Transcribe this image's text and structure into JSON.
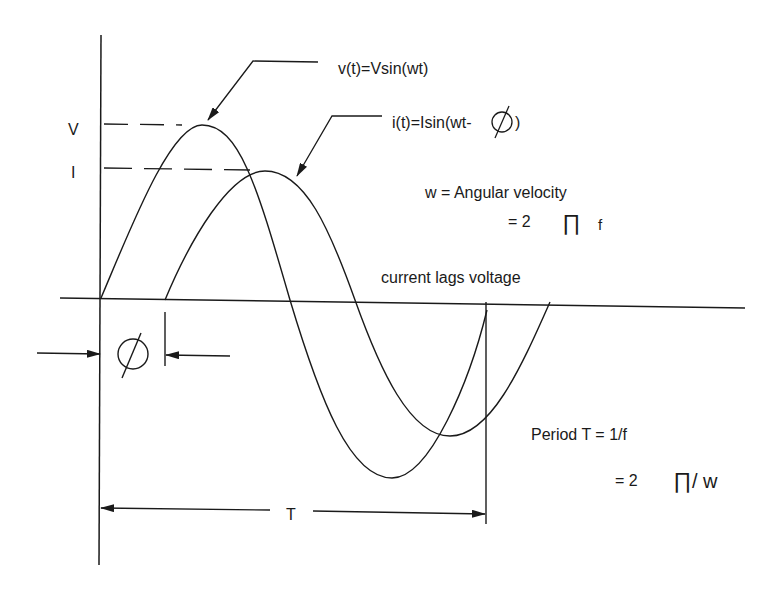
{
  "diagram": {
    "axis_labels": {
      "v_peak": "V",
      "i_peak": "I"
    },
    "callouts": {
      "voltage": "v(t)=Vsin(wt)",
      "current_prefix": "i(t)=Isin(wt-",
      "current_suffix": ")"
    },
    "notes": {
      "angular_velocity": "w = Angular velocity",
      "angular_eq_prefix": "= 2",
      "angular_eq_pi": "∏",
      "angular_eq_suffix": "f",
      "lag": "current lags voltage",
      "period": "Period T = 1/f",
      "period_eq_prefix": "= 2",
      "period_eq_pi": "∏",
      "period_eq_suffix": "/ w"
    },
    "dimensions": {
      "phase_symbol": "Ø",
      "period_symbol": "T"
    },
    "colors": {
      "ink": "#1a1a1a",
      "background": "#ffffff"
    }
  }
}
